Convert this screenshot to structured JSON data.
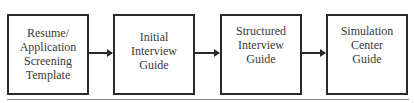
{
  "diagram": {
    "type": "flowchart",
    "direction": "left-to-right",
    "nodes": [
      {
        "id": "n1",
        "label": "Resume/\nApplication\nScreening\nTemplate"
      },
      {
        "id": "n2",
        "label": "Initial\nInterview\nGuide"
      },
      {
        "id": "n3",
        "label": "Structured\nInterview\nGuide"
      },
      {
        "id": "n4",
        "label": "Simulation\nCenter\nGuide"
      }
    ],
    "edges": [
      {
        "from": "n1",
        "to": "n2"
      },
      {
        "from": "n2",
        "to": "n3"
      },
      {
        "from": "n3",
        "to": "n4"
      }
    ],
    "colors": {
      "border": "#2a2a2a",
      "text": "#3a3a3a",
      "rule": "#8a8a8a"
    }
  }
}
